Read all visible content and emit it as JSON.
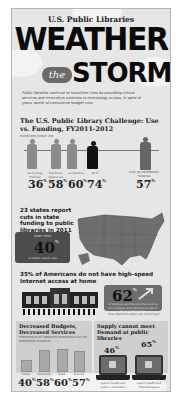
{
  "header": {
    "kicker": "U.S. Public Libraries",
    "title_line1": "WEATHER",
    "title_the": "the",
    "title_line2": "STORM",
    "intro": "Public libraries continue to transform lives by providing critical services and innovative solutions to technology access, in spite of years' worth of cumulative budget cuts."
  },
  "challenge": {
    "title": "The U.S. Public Library Challenge: Use vs. Funding, FY2011-2012",
    "subtitle": "INCREASED PUBLIC USE",
    "items": [
      {
        "label": "Technology Training",
        "value": "36",
        "unit": "%"
      },
      {
        "label": "Electronic Resources",
        "value": "58",
        "unit": "%"
      },
      {
        "label": "Computers",
        "value": "60",
        "unit": "%"
      },
      {
        "label": "Wi-Fi",
        "value": "74",
        "unit": "%"
      }
    ],
    "funding": {
      "label": "FLAT OR DECREASED FUNDING",
      "value": "57",
      "unit": "%"
    }
  },
  "states": {
    "title": "23 states report cuts in state funding to public libraries in 2011",
    "box_label": "MORE THAN",
    "box_value": "40",
    "box_unit": "%",
    "box_caption": "of states report cuts"
  },
  "internet": {
    "title": "35% of Americans do not have high-speed Internet access at home",
    "value": "62",
    "unit": "%",
    "caption": "of libraries are the only free source of computer and Internet access in their communities",
    "source": "Pew Internet & American Life Project"
  },
  "budgets": {
    "title": "Decreased Budgets, Decreased Services",
    "subtitle": "PERCENTAGE OF LIBRARIES REPORTING FLAT OR DECREASED BUDGETS",
    "bars": [
      {
        "label": "Urban",
        "value": "40",
        "unit": "%",
        "height": 24
      },
      {
        "label": "Suburban",
        "value": "58",
        "unit": "%",
        "height": 36
      },
      {
        "label": "Rural",
        "value": "60",
        "unit": "%",
        "height": 38
      },
      {
        "label": "Overall",
        "value": "57",
        "unit": "%",
        "height": 35
      }
    ]
  },
  "supply": {
    "title": "Supply cannot meet Demand at public libraries",
    "items": [
      {
        "value": "46",
        "unit": "%",
        "caption": "report insufficient public computers"
      },
      {
        "value": "65",
        "unit": "%",
        "caption": "report insufficient Internet speed"
      }
    ]
  }
}
